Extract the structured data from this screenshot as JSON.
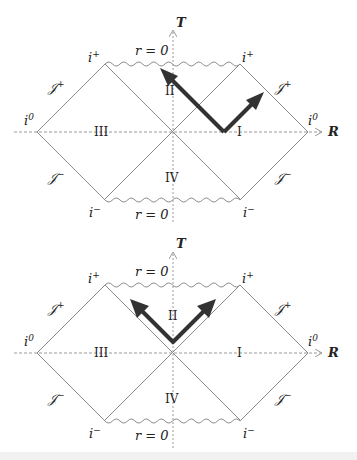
{
  "colors": {
    "line": "#8a8a8a",
    "arrow": "#333333",
    "axis": "#9a9a9a",
    "text": "#222222"
  },
  "diagrams": [
    {
      "id": "top",
      "axis_labels": {
        "T": "T",
        "R": "R"
      },
      "singularities": {
        "top": "r = 0",
        "bottom": "r = 0"
      },
      "regions": {
        "I": "I",
        "II": "II",
        "III": "III",
        "IV": "IV"
      },
      "infinities": {
        "i_plus_left": "i+",
        "i_plus_right": "i+",
        "i_zero_left": "i0",
        "i_zero_right": "i0",
        "i_minus_left": "i−",
        "i_minus_right": "i−",
        "scri_plus_left": "𝒥+",
        "scri_plus_right": "𝒥+",
        "scri_minus_left": "𝒥−",
        "scri_minus_right": "𝒥−"
      },
      "arrows": "light rays from region I: one toward future horizon into II, one outgoing to 𝒥+"
    },
    {
      "id": "bottom",
      "axis_labels": {
        "T": "T",
        "R": "R"
      },
      "singularities": {
        "top": "r = 0",
        "bottom": "r = 0"
      },
      "regions": {
        "I": "I",
        "II": "II",
        "III": "III",
        "IV": "IV"
      },
      "infinities": {
        "i_plus_left": "i+",
        "i_plus_right": "i+",
        "i_zero_left": "i0",
        "i_zero_right": "i0",
        "i_minus_left": "i−",
        "i_minus_right": "i−",
        "scri_plus_left": "𝒥+",
        "scri_plus_right": "𝒥+",
        "scri_minus_left": "𝒥−",
        "scri_minus_right": "𝒥−"
      },
      "arrows": "two light rays from inside region II both ending at singularity r = 0"
    }
  ],
  "text": {
    "T": "T",
    "R": "R",
    "r0": "r = 0",
    "I": "I",
    "II": "II",
    "III": "III",
    "IV": "IV",
    "i": "i",
    "plus": "+",
    "minus": "−",
    "zero": "0",
    "scri": "𝒥"
  }
}
